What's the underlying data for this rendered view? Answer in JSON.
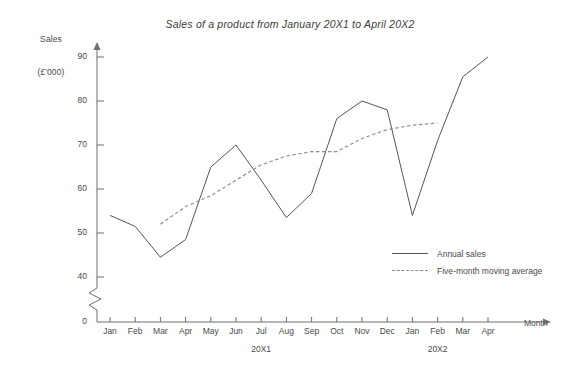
{
  "chart_data": {
    "type": "line",
    "title": "Sales of a product from January 20X1 to April 20X2",
    "xlabel": "Month",
    "ylabel": "Sales (£'000)",
    "ylabel_line1": "Sales",
    "ylabel_line2": "(£'000)",
    "ylim": [
      40,
      95
    ],
    "yticks": [
      40,
      50,
      60,
      70,
      80,
      90
    ],
    "ytick_labels": [
      "40",
      "50",
      "60",
      "70",
      "80",
      "90"
    ],
    "origin_label": "0",
    "axis_break": true,
    "grid": false,
    "legend_position": "inside-lower-right",
    "categories": [
      "Jan",
      "Feb",
      "Mar",
      "Apr",
      "May",
      "Jun",
      "Jul",
      "Aug",
      "Sep",
      "Oct",
      "Nov",
      "Dec",
      "Jan",
      "Feb",
      "Mar",
      "Apr"
    ],
    "group_labels": [
      {
        "text": "20X1",
        "center_category": "Jun"
      },
      {
        "text": "20X2",
        "center_category": "Feb"
      }
    ],
    "series": [
      {
        "name": "Annual sales",
        "style": "solid",
        "color": "#555555",
        "values": [
          54,
          51.5,
          44.5,
          48.5,
          65,
          70,
          62,
          53.5,
          59,
          76,
          80,
          78,
          54,
          71,
          85.5,
          90
        ]
      },
      {
        "name": "Five-month moving average",
        "style": "dashed",
        "color": "#8a8a8a",
        "values": [
          null,
          null,
          52,
          56,
          58.5,
          62,
          65.5,
          67.5,
          68.5,
          68.5,
          71.5,
          73.5,
          74.5,
          75,
          null,
          null
        ]
      }
    ]
  },
  "legend": {
    "items": [
      {
        "label": "Annual sales",
        "style": "solid"
      },
      {
        "label": "Five-month moving average",
        "style": "dashed"
      }
    ]
  }
}
